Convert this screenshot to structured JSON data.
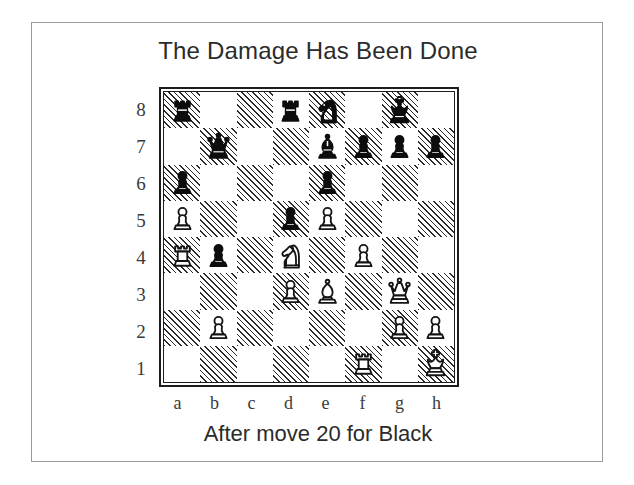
{
  "figure": {
    "title": "The Damage Has Been Done",
    "caption": "After move 20 for Black"
  },
  "board": {
    "file_labels": [
      "a",
      "b",
      "c",
      "d",
      "e",
      "f",
      "g",
      "h"
    ],
    "rank_labels": [
      "8",
      "7",
      "6",
      "5",
      "4",
      "3",
      "2",
      "1"
    ],
    "orientation": "white-bottom",
    "light_square_color": "#ffffff",
    "dark_square_color": "#2a2a2a",
    "dark_square_style": "diagonal-hatch",
    "border_color": "#1d1d1d",
    "position_fen": "r2rn1k1/1q2bppp/p3p3/P2pP3/Rp1N1P2/3PB1Q1/1P4PP/5R1K",
    "ranks": [
      {
        "rank": "8",
        "squares": [
          {
            "square": "a8",
            "shade": "dark",
            "piece": "black-rook"
          },
          {
            "square": "b8",
            "shade": "light",
            "piece": ""
          },
          {
            "square": "c8",
            "shade": "dark",
            "piece": ""
          },
          {
            "square": "d8",
            "shade": "light",
            "piece": "black-rook"
          },
          {
            "square": "e8",
            "shade": "dark",
            "piece": "black-knight"
          },
          {
            "square": "f8",
            "shade": "light",
            "piece": ""
          },
          {
            "square": "g8",
            "shade": "dark",
            "piece": "black-king"
          },
          {
            "square": "h8",
            "shade": "light",
            "piece": ""
          }
        ]
      },
      {
        "rank": "7",
        "squares": [
          {
            "square": "a7",
            "shade": "light",
            "piece": ""
          },
          {
            "square": "b7",
            "shade": "dark",
            "piece": "black-queen"
          },
          {
            "square": "c7",
            "shade": "light",
            "piece": ""
          },
          {
            "square": "d7",
            "shade": "dark",
            "piece": ""
          },
          {
            "square": "e7",
            "shade": "light",
            "piece": "black-bishop"
          },
          {
            "square": "f7",
            "shade": "dark",
            "piece": "black-pawn"
          },
          {
            "square": "g7",
            "shade": "light",
            "piece": "black-pawn"
          },
          {
            "square": "h7",
            "shade": "dark",
            "piece": "black-pawn"
          }
        ]
      },
      {
        "rank": "6",
        "squares": [
          {
            "square": "a6",
            "shade": "dark",
            "piece": "black-pawn"
          },
          {
            "square": "b6",
            "shade": "light",
            "piece": ""
          },
          {
            "square": "c6",
            "shade": "dark",
            "piece": ""
          },
          {
            "square": "d6",
            "shade": "light",
            "piece": ""
          },
          {
            "square": "e6",
            "shade": "dark",
            "piece": "black-pawn"
          },
          {
            "square": "f6",
            "shade": "light",
            "piece": ""
          },
          {
            "square": "g6",
            "shade": "dark",
            "piece": ""
          },
          {
            "square": "h6",
            "shade": "light",
            "piece": ""
          }
        ]
      },
      {
        "rank": "5",
        "squares": [
          {
            "square": "a5",
            "shade": "light",
            "piece": "white-pawn"
          },
          {
            "square": "b5",
            "shade": "dark",
            "piece": ""
          },
          {
            "square": "c5",
            "shade": "light",
            "piece": ""
          },
          {
            "square": "d5",
            "shade": "dark",
            "piece": "black-pawn"
          },
          {
            "square": "e5",
            "shade": "light",
            "piece": "white-pawn"
          },
          {
            "square": "f5",
            "shade": "dark",
            "piece": ""
          },
          {
            "square": "g5",
            "shade": "light",
            "piece": ""
          },
          {
            "square": "h5",
            "shade": "dark",
            "piece": ""
          }
        ]
      },
      {
        "rank": "4",
        "squares": [
          {
            "square": "a4",
            "shade": "dark",
            "piece": "white-rook"
          },
          {
            "square": "b4",
            "shade": "light",
            "piece": "black-pawn"
          },
          {
            "square": "c4",
            "shade": "dark",
            "piece": ""
          },
          {
            "square": "d4",
            "shade": "light",
            "piece": "white-knight"
          },
          {
            "square": "e4",
            "shade": "dark",
            "piece": ""
          },
          {
            "square": "f4",
            "shade": "light",
            "piece": "white-pawn"
          },
          {
            "square": "g4",
            "shade": "dark",
            "piece": ""
          },
          {
            "square": "h4",
            "shade": "light",
            "piece": ""
          }
        ]
      },
      {
        "rank": "3",
        "squares": [
          {
            "square": "a3",
            "shade": "light",
            "piece": ""
          },
          {
            "square": "b3",
            "shade": "dark",
            "piece": ""
          },
          {
            "square": "c3",
            "shade": "light",
            "piece": ""
          },
          {
            "square": "d3",
            "shade": "dark",
            "piece": "white-pawn"
          },
          {
            "square": "e3",
            "shade": "light",
            "piece": "white-bishop"
          },
          {
            "square": "f3",
            "shade": "dark",
            "piece": ""
          },
          {
            "square": "g3",
            "shade": "light",
            "piece": "white-queen"
          },
          {
            "square": "h3",
            "shade": "dark",
            "piece": ""
          }
        ]
      },
      {
        "rank": "2",
        "squares": [
          {
            "square": "a2",
            "shade": "dark",
            "piece": ""
          },
          {
            "square": "b2",
            "shade": "light",
            "piece": "white-pawn"
          },
          {
            "square": "c2",
            "shade": "dark",
            "piece": ""
          },
          {
            "square": "d2",
            "shade": "light",
            "piece": ""
          },
          {
            "square": "e2",
            "shade": "dark",
            "piece": ""
          },
          {
            "square": "f2",
            "shade": "light",
            "piece": ""
          },
          {
            "square": "g2",
            "shade": "dark",
            "piece": "white-pawn"
          },
          {
            "square": "h2",
            "shade": "light",
            "piece": "white-pawn"
          }
        ]
      },
      {
        "rank": "1",
        "squares": [
          {
            "square": "a1",
            "shade": "light",
            "piece": ""
          },
          {
            "square": "b1",
            "shade": "dark",
            "piece": ""
          },
          {
            "square": "c1",
            "shade": "light",
            "piece": ""
          },
          {
            "square": "d1",
            "shade": "dark",
            "piece": ""
          },
          {
            "square": "e1",
            "shade": "light",
            "piece": ""
          },
          {
            "square": "f1",
            "shade": "dark",
            "piece": "white-rook"
          },
          {
            "square": "g1",
            "shade": "light",
            "piece": ""
          },
          {
            "square": "h1",
            "shade": "dark",
            "piece": "white-king"
          }
        ]
      }
    ]
  }
}
